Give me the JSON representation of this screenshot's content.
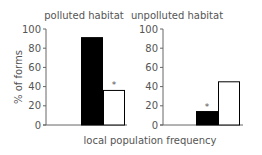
{
  "chart_data": [
    {
      "type": "bar",
      "title": "polluted habitat",
      "categories": [
        "form A",
        "form B"
      ],
      "values": [
        91,
        36
      ],
      "colors": [
        "#000000",
        "#ffffff"
      ],
      "annotations": [
        {
          "category": "form B",
          "text": "*"
        }
      ],
      "ylabel": "% of forms",
      "xlabel": "local population frequency",
      "ylim": [
        0,
        100
      ],
      "yticks": [
        0,
        20,
        40,
        60,
        80,
        100
      ],
      "grid": false
    },
    {
      "type": "bar",
      "title": "unpolluted habitat",
      "categories": [
        "form A",
        "form B"
      ],
      "values": [
        14,
        45
      ],
      "colors": [
        "#000000",
        "#ffffff"
      ],
      "annotations": [
        {
          "category": "form A",
          "text": "*"
        }
      ],
      "ylabel": "",
      "xlabel": "local population frequency",
      "ylim": [
        0,
        100
      ],
      "yticks": [
        0,
        20,
        40,
        60,
        80,
        100
      ],
      "grid": false
    }
  ],
  "labels": {
    "left_title": "polluted habitat",
    "right_title": "unpolluted habitat",
    "ylabel": "% of forms",
    "xlabel": "local population frequency",
    "asterisk": "*"
  }
}
